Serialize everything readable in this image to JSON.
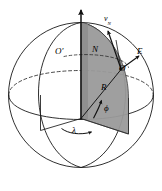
{
  "figure": {
    "background_color": "#ffffff",
    "stroke_color": "#1a1a1a",
    "wedge_fill_color": "#9a9a9a",
    "wedge_fill_color_dark": "#8c8c8c",
    "dashed_color": "#2b2b2b"
  },
  "labels": {
    "velocity_north": "v",
    "velocity_north_sub": "N",
    "origin_prime": "O′",
    "north_point": "N",
    "east_point": "E",
    "observer_point": "O",
    "radius": "R",
    "latitude": "ϕ",
    "longitude": "λ"
  },
  "geometry": {
    "sphere_center_x": 81,
    "sphere_center_y": 95,
    "sphere_radius_x": 73,
    "sphere_radius_y": 73,
    "polar_axis_top_y": 8,
    "equator_tilt": 0.3,
    "observer_x": 122,
    "observer_y": 69
  },
  "elements": [
    {
      "name": "sphere-outline",
      "kind": "circle"
    },
    {
      "name": "polar-axis",
      "kind": "arrow-vector"
    },
    {
      "name": "equator-dashed-arc",
      "kind": "dashed-ellipse-arc"
    },
    {
      "name": "equator-solid-arc",
      "kind": "ellipse-arc"
    },
    {
      "name": "meridian-front-arc",
      "kind": "ellipse-arc"
    },
    {
      "name": "meridian-back-arc",
      "kind": "ellipse-arc"
    },
    {
      "name": "meridian-wedge",
      "kind": "filled-sector"
    },
    {
      "name": "prime-meridian-wedge",
      "kind": "sector-outline"
    },
    {
      "name": "radius-line",
      "kind": "line"
    },
    {
      "name": "latitude-angle-arc",
      "kind": "arc-arrow"
    },
    {
      "name": "longitude-angle-arc",
      "kind": "arc-arrow"
    },
    {
      "name": "east-vector",
      "kind": "arrow-vector"
    },
    {
      "name": "north-velocity-vector",
      "kind": "arrow-vector"
    },
    {
      "name": "latitude-circle-dashed",
      "kind": "dashed-ellipse-arc"
    }
  ]
}
